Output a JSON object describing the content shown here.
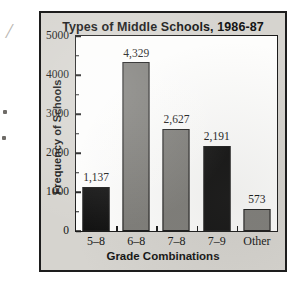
{
  "figure": {
    "frame_bg": "#d6d4cf",
    "plot_bg": "#fdfdfc",
    "axis_color": "#1b1b1b"
  },
  "margin_mark": {
    "glyph": "/"
  },
  "chart_data": {
    "type": "bar",
    "title": "Types of Middle Schools, 1986-87",
    "xlabel": "Grade Combinations",
    "ylabel": "Frequency of Schools",
    "categories": [
      "5–8",
      "6–8",
      "7–8",
      "7–9",
      "Other"
    ],
    "values": [
      1137,
      4329,
      2627,
      2191,
      573
    ],
    "value_labels": [
      "1,137",
      "4,329",
      "2,627",
      "2,191",
      "573"
    ],
    "bar_colors": [
      "#121212",
      "#7e7d79",
      "#7e7d79",
      "#121212",
      "#7e7d79"
    ],
    "ylim": [
      0,
      5000
    ],
    "yticks": [
      0,
      1000,
      2000,
      3000,
      4000,
      5000
    ],
    "ytick_labels": [
      "0",
      "1000",
      "2000",
      "3000",
      "4000",
      "5000"
    ],
    "y_minor_step": 500,
    "grid": false,
    "legend": null
  }
}
